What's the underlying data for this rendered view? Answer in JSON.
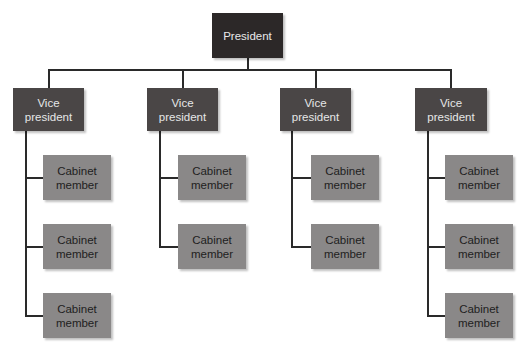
{
  "chart": {
    "type": "org-chart",
    "colors": {
      "president_fill": "#2c2828",
      "vp_fill": "#4a4646",
      "cabinet_fill": "#8a8888",
      "connector": "#2a2a2a"
    },
    "president": {
      "label": "President"
    },
    "vice_presidents": [
      {
        "label": "Vice\npresident",
        "cabinet": [
          "Cabinet\nmember",
          "Cabinet\nmember",
          "Cabinet\nmember"
        ]
      },
      {
        "label": "Vice\npresident",
        "cabinet": [
          "Cabinet\nmember",
          "Cabinet\nmember"
        ]
      },
      {
        "label": "Vice\npresident",
        "cabinet": [
          "Cabinet\nmember",
          "Cabinet\nmember"
        ]
      },
      {
        "label": "Vice\npresident",
        "cabinet": [
          "Cabinet\nmember",
          "Cabinet\nmember",
          "Cabinet\nmember"
        ]
      }
    ]
  }
}
